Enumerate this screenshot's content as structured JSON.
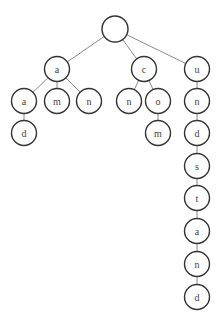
{
  "diagram": {
    "type": "trie",
    "node_radius": 12.5,
    "root_radius": 13,
    "colors": {
      "node_stroke": "#333333",
      "node_fill": "#ffffff",
      "edge": "#8a8a8a",
      "label": "#444444"
    },
    "nodes": [
      {
        "id": "root",
        "label": "",
        "x": 115,
        "y": 29,
        "r": 13
      },
      {
        "id": "a1",
        "label": "a",
        "x": 57,
        "y": 69
      },
      {
        "id": "c1",
        "label": "c",
        "x": 144,
        "y": 69
      },
      {
        "id": "u1",
        "label": "u",
        "x": 197,
        "y": 69
      },
      {
        "id": "a2",
        "label": "a",
        "x": 24,
        "y": 101
      },
      {
        "id": "m2",
        "label": "m",
        "x": 57,
        "y": 101
      },
      {
        "id": "n2",
        "label": "n",
        "x": 89,
        "y": 101
      },
      {
        "id": "n2c",
        "label": "n",
        "x": 129,
        "y": 101
      },
      {
        "id": "o2",
        "label": "o",
        "x": 158,
        "y": 101
      },
      {
        "id": "n2u",
        "label": "n",
        "x": 197,
        "y": 101
      },
      {
        "id": "d3",
        "label": "d",
        "x": 24,
        "y": 133
      },
      {
        "id": "m3",
        "label": "m",
        "x": 158,
        "y": 133
      },
      {
        "id": "d3u",
        "label": "d",
        "x": 197,
        "y": 133
      },
      {
        "id": "s4",
        "label": "s",
        "x": 197,
        "y": 166
      },
      {
        "id": "t5",
        "label": "t",
        "x": 197,
        "y": 198
      },
      {
        "id": "a6",
        "label": "a",
        "x": 197,
        "y": 231
      },
      {
        "id": "n7",
        "label": "n",
        "x": 197,
        "y": 264
      },
      {
        "id": "d8",
        "label": "d",
        "x": 197,
        "y": 297
      }
    ],
    "edges": [
      [
        "root",
        "a1"
      ],
      [
        "root",
        "c1"
      ],
      [
        "root",
        "u1"
      ],
      [
        "a1",
        "a2"
      ],
      [
        "a1",
        "m2"
      ],
      [
        "a1",
        "n2"
      ],
      [
        "c1",
        "n2c"
      ],
      [
        "c1",
        "o2"
      ],
      [
        "u1",
        "n2u"
      ],
      [
        "a2",
        "d3"
      ],
      [
        "o2",
        "m3"
      ],
      [
        "n2u",
        "d3u"
      ],
      [
        "d3u",
        "s4"
      ],
      [
        "s4",
        "t5"
      ],
      [
        "t5",
        "a6"
      ],
      [
        "a6",
        "n7"
      ],
      [
        "n7",
        "d8"
      ]
    ],
    "words": [
      "a",
      "ad",
      "am",
      "an",
      "cn",
      "com",
      "understand"
    ]
  }
}
